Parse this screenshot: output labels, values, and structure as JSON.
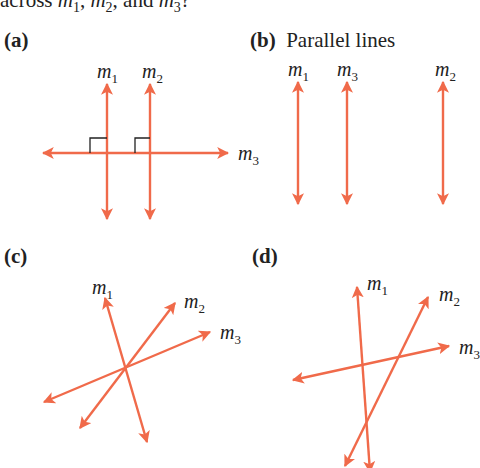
{
  "header": {
    "prefix": "across ",
    "m1": "m",
    "m1_sub": "1",
    "sep1": ", ",
    "m2": "m",
    "m2_sub": "2",
    "sep2": ", and ",
    "m3": "m",
    "m3_sub": "3",
    "suffix": "?"
  },
  "line_color": "#f06a4a",
  "panels": [
    {
      "id": "a",
      "tag": "(a)",
      "caption": ""
    },
    {
      "id": "b",
      "tag": "(b)",
      "caption": "Parallel lines"
    },
    {
      "id": "c",
      "tag": "(c)",
      "caption": ""
    },
    {
      "id": "d",
      "tag": "(d)",
      "caption": ""
    }
  ],
  "labels": {
    "m": "m",
    "s1": "1",
    "s2": "2",
    "s3": "3"
  }
}
